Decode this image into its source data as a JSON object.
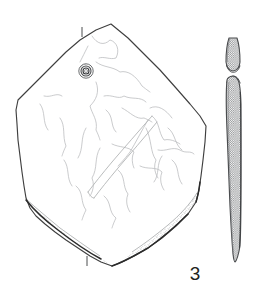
{
  "figure": {
    "label": "3",
    "domain_note": "archaeological line drawing",
    "background_color": "#ffffff",
    "ink_color": "#231f20",
    "outline_color": "#3a3a3a",
    "faint_line_color": "#b9bbbd",
    "hatch_color": "#8d8f92",
    "stipple_color": "#9a9c9e"
  },
  "views": {
    "plan": {
      "name": "plan-view",
      "description": "Perforated stone plaque, face view",
      "bbox": {
        "x": 14,
        "y": 22,
        "width": 196,
        "height": 248
      },
      "outline_points": "111,24 128,38 144,54 160,70 176,88 190,104 200,116 206,126 205,142 203,160 201,176 199,190 196,202 188,214 176,226 162,238 148,248 134,256 122,262 112,266 101,262 90,256 78,248 66,240 55,232 45,224 36,216 30,208 26,198 24,186 22,172 20,156 18,140 17,124 16,110 18,100 26,92 38,80 52,66 66,52 80,40 96,30",
      "perforation": {
        "name": "drilled-perforation",
        "center_x": 86,
        "center_y": 71,
        "outer_radius": 7.2,
        "mid_radius": 5.0,
        "inner_radius": 3.0,
        "bore_radius": 1.6
      },
      "section_ticks": [
        {
          "name": "section-tick-top",
          "x": 82,
          "y1": 27,
          "y2": 37
        },
        {
          "name": "section-tick-bottom",
          "x": 87,
          "y1": 256,
          "y2": 266
        }
      ],
      "surface_fracture_lines": [
        "92,36 97,44 104,46 110,40 117,42 120,50 116,58 110,60 104,56 99,58",
        "88,46 84,54 80,62",
        "96,62 104,68 112,66 120,72 128,70 136,76 142,86 150,92",
        "96,82 100,92 96,100 90,106 92,114 98,120 96,130 100,140",
        "104,96 112,94 118,100 124,96 132,100 140,96 146,102",
        "122,108 130,112 136,120 144,118 152,122",
        "60,118 66,126 62,136 66,146 62,156",
        "150,108 158,104 166,110 172,118",
        "148,120 142,130 136,142 130,152 124,160 118,166",
        "152,116 160,122 158,132 164,140 172,138 180,144",
        "146,128 152,140 150,152 156,160 152,170 158,178",
        "112,144 120,148 128,146 134,152 130,160 134,168",
        "100,148 94,158 98,168 92,178 96,188 90,196",
        "118,170 126,176 122,186 128,194 124,204 130,212",
        "140,166 148,170 156,166 162,172 158,182 164,190",
        "76,186 84,192 80,202 86,210 82,220",
        "104,196 112,202 108,212 116,218 112,228",
        "64,160 70,168 66,178 72,186",
        "168,128 176,134 174,144 182,150",
        "86,128 80,138 84,148 78,158"
      ],
      "contour_lines": [
        "148,118 134,134 120,150 108,164 98,176 90,186 84,194",
        "152,124 140,140 126,156 114,170 104,182 96,192 90,200"
      ],
      "broken_edge": {
        "name": "broken-edge-band",
        "left_band": "26,198 36,210 48,222 60,232 74,242 88,252 100,258 112,264",
        "right_band": "196,196 188,208 178,218 166,228 154,238 142,246 130,254 118,260"
      }
    },
    "profile": {
      "name": "profile-section-view",
      "description": "Cross-section through perforation, hatched",
      "bbox": {
        "x": 222,
        "y": 36,
        "width": 22,
        "height": 238
      },
      "upper_segment_outline": "229,38 227,44 226,54 226,62 228,68 233,71 238,68 240,62 240,52 239,44 237,38",
      "lower_segment_outline": "227,80 226,90 226,106 227,130 228,156 229,182 230,206 231,226 232,242 233,254 235,262 238,258 240,246 241,228 241,206 241,180 241,154 241,128 241,104 240,88 238,80 233,76",
      "perforation_notch": {
        "name": "perforation-notch",
        "upper_arc": "228,68 231,72 235,72 239,67",
        "lower_arc": "227,81 231,77 236,77 240,82"
      },
      "hatch_spacing": 2.2
    }
  }
}
